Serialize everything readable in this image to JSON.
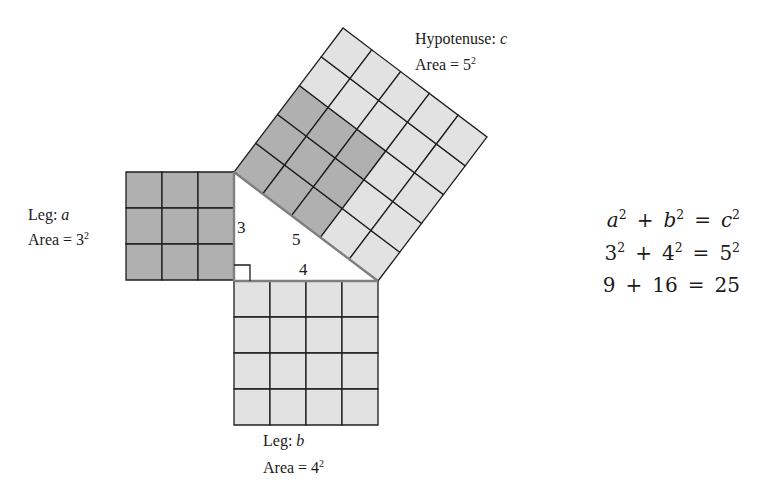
{
  "colors": {
    "dark_cell": "#b0b0b0",
    "light_cell": "#e2e2e2",
    "grid_line": "#1e1e1e",
    "triangle_edge": "#808080"
  },
  "squares": {
    "leg_a": {
      "side": 3,
      "shade": "dark",
      "label": "Leg:",
      "var": "a",
      "area_text": "Area = 3",
      "area_exp": "2"
    },
    "leg_b": {
      "side": 4,
      "shade": "light",
      "label": "Leg:",
      "var": "b",
      "area_text": "Area = 4",
      "area_exp": "2"
    },
    "hypotenuse": {
      "side": 5,
      "shade": "light",
      "dark_block": 3,
      "label": "Hypotenuse:",
      "var": "c",
      "area_text": "Area = 5",
      "area_exp": "2"
    }
  },
  "triangle": {
    "side_labels": {
      "a": "3",
      "b": "4",
      "c": "5"
    },
    "right_angle_marker": true
  },
  "equations": [
    {
      "parts": [
        {
          "base": "a",
          "italic": true,
          "exp": "2"
        },
        {
          "op": "+"
        },
        {
          "base": "b",
          "italic": true,
          "exp": "2"
        },
        {
          "op": "="
        },
        {
          "base": "c",
          "italic": true,
          "exp": "2"
        }
      ]
    },
    {
      "parts": [
        {
          "base": "3",
          "exp": "2"
        },
        {
          "op": "+"
        },
        {
          "base": "4",
          "exp": "2"
        },
        {
          "op": "="
        },
        {
          "base": "5",
          "exp": "2"
        }
      ]
    },
    {
      "parts": [
        {
          "base": "9"
        },
        {
          "op": "+"
        },
        {
          "base": "16"
        },
        {
          "op": "="
        },
        {
          "base": "25"
        }
      ]
    }
  ]
}
